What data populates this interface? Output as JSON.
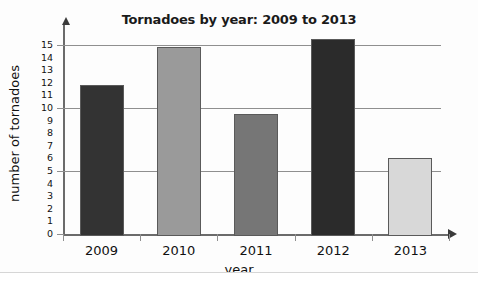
{
  "chart_data": {
    "type": "bar",
    "title": "Tornadoes by year: 2009 to 2013",
    "xlabel": "year",
    "ylabel": "number of tornadoes",
    "categories": [
      "2009",
      "2010",
      "2011",
      "2012",
      "2013"
    ],
    "values": [
      12,
      15,
      9.7,
      15.6,
      6.2
    ],
    "bar_colors": [
      "#333333",
      "#9a9a9a",
      "#767676",
      "#2b2b2b",
      "#d8d8d8"
    ],
    "ylim": [
      0,
      15
    ],
    "ytick_labels": [
      "0",
      "1",
      "2",
      "3",
      "4",
      "5",
      "6",
      "7",
      "8",
      "9",
      "10",
      "11",
      "12",
      "13",
      "14",
      "15"
    ],
    "ytick_values": [
      0,
      1,
      2,
      3,
      4,
      5,
      6,
      7,
      8,
      9,
      10,
      11,
      12,
      13,
      14,
      15
    ],
    "major_gridlines": [
      5,
      10,
      15
    ],
    "grid": true,
    "legend": false
  },
  "colors": {
    "axis": "#6b6b6b",
    "gridline": "#8f8f8f",
    "text": "#111111",
    "card_background": "#fdfdfd"
  }
}
